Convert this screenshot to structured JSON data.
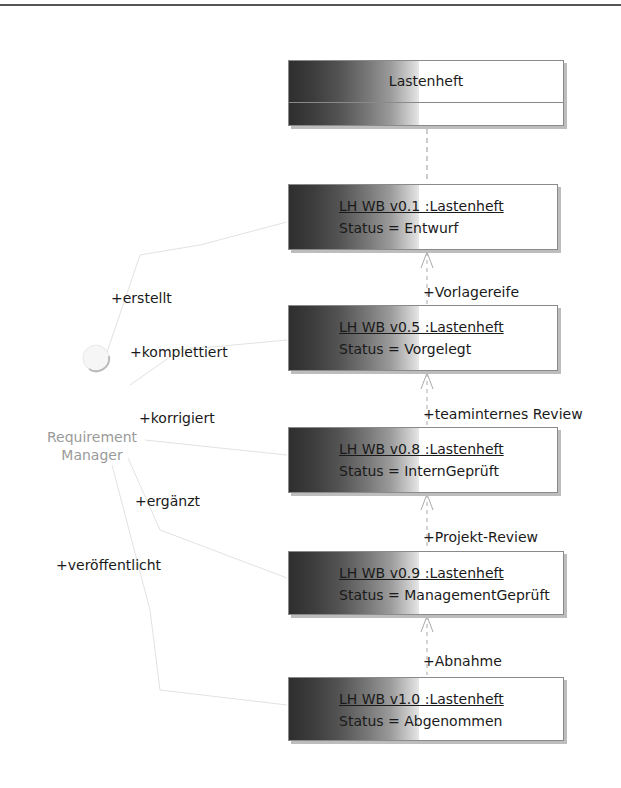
{
  "diagram": {
    "class_box": {
      "name": "Lastenheft"
    },
    "actor": {
      "line1": "Requirement",
      "line2": "Manager"
    },
    "objects": [
      {
        "name": "LH WB v0.1 :Lastenheft",
        "status": "Status = Entwurf"
      },
      {
        "name": "LH WB v0.5 :Lastenheft",
        "status": "Status = Vorgelegt"
      },
      {
        "name": "LH WB v0.8 :Lastenheft",
        "status": "Status = InternGeprüft"
      },
      {
        "name": "LH WB v0.9 :Lastenheft",
        "status": "Status = ManagementGeprüft"
      },
      {
        "name": "LH WB v1.0 :Lastenheft",
        "status": "Status = Abgenommen"
      }
    ],
    "transitions": [
      "+Vorlagereife",
      "+teaminternes Review",
      "+Projekt-Review",
      "+Abnahme"
    ],
    "actor_roles": [
      "+erstellt",
      "+komplettiert",
      "+korrigiert",
      "+ergänzt",
      "+veröffentlicht"
    ]
  }
}
